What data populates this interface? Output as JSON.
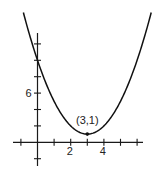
{
  "chart_data": {
    "type": "line",
    "title": "",
    "xlabel": "",
    "ylabel": "",
    "function": "y = (x - 3)^2 + 1",
    "series": [
      {
        "name": "parabola",
        "x": [
          -0.8,
          -0.5,
          0,
          0.5,
          1,
          1.5,
          2,
          2.5,
          3,
          3.5,
          4,
          4.5,
          5,
          5.5,
          6,
          6.5,
          6.8
        ],
        "y": [
          15.44,
          13.25,
          10,
          7.25,
          5,
          3.25,
          2,
          1.25,
          1,
          1.25,
          2,
          3.25,
          5,
          7.25,
          10,
          13.25,
          15.44
        ]
      }
    ],
    "x_ticks": [
      -1,
      0,
      1,
      2,
      3,
      4,
      5,
      6
    ],
    "x_tick_labels": [
      {
        "value": 2,
        "label": "2"
      },
      {
        "value": 4,
        "label": "4"
      }
    ],
    "y_ticks": [
      -2,
      2,
      4,
      6,
      8,
      10,
      12
    ],
    "y_tick_labels": [
      {
        "value": 6,
        "label": "6"
      }
    ],
    "annotations": [
      {
        "x": 3,
        "y": 1,
        "text": "(3,1)",
        "marker": "dot"
      }
    ],
    "xlim": [
      -1.5,
      6.5
    ],
    "ylim": [
      -4,
      16
    ],
    "grid": false,
    "legend": "none"
  },
  "geom": {
    "origin_px": [
      37.5,
      142.3
    ],
    "x_unit_px": 16.6,
    "y_unit_px": 8.2,
    "x_axis_px": [
      13,
      143
    ],
    "y_axis_px": [
      33,
      166
    ]
  },
  "labels": {
    "vertex": "(3,1)",
    "x2": "2",
    "x4": "4",
    "y6": "6"
  },
  "colors": {
    "ink": "#111111",
    "background": "#ffffff"
  }
}
